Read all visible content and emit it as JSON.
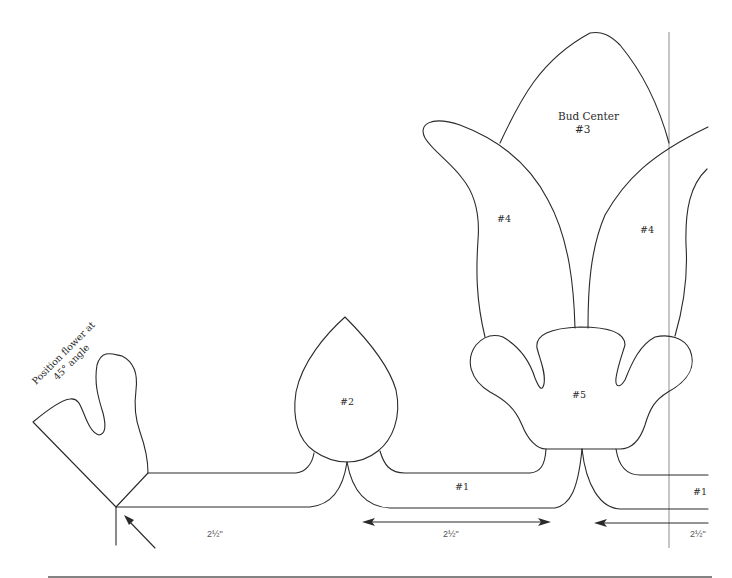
{
  "diagram": {
    "type": "applique-pattern-template",
    "colors": {
      "line": "#2a2a2a",
      "guide_line": "#b8b8b8",
      "bottom_rule": "#5a5a5a",
      "background": "#ffffff"
    },
    "labels": {
      "position_note_line1": "Position flower at",
      "position_note_line2": "45° angle",
      "bud_center_line1": "Bud Center",
      "bud_center_line2": "#3",
      "piece_2": "#2",
      "piece_4_left": "#4",
      "piece_4_right": "#4",
      "piece_5": "#5",
      "piece_1_center": "#1",
      "piece_1_right": "#1"
    },
    "dimensions": {
      "left": "2½\"",
      "center": "2½\"",
      "right": "2½\""
    },
    "pieces": [
      {
        "id": "#1",
        "name": "Stem band"
      },
      {
        "id": "#2",
        "name": "Teardrop bud"
      },
      {
        "id": "#3",
        "name": "Bud Center"
      },
      {
        "id": "#4",
        "name": "Side petal"
      },
      {
        "id": "#5",
        "name": "Calyx base"
      }
    ]
  }
}
